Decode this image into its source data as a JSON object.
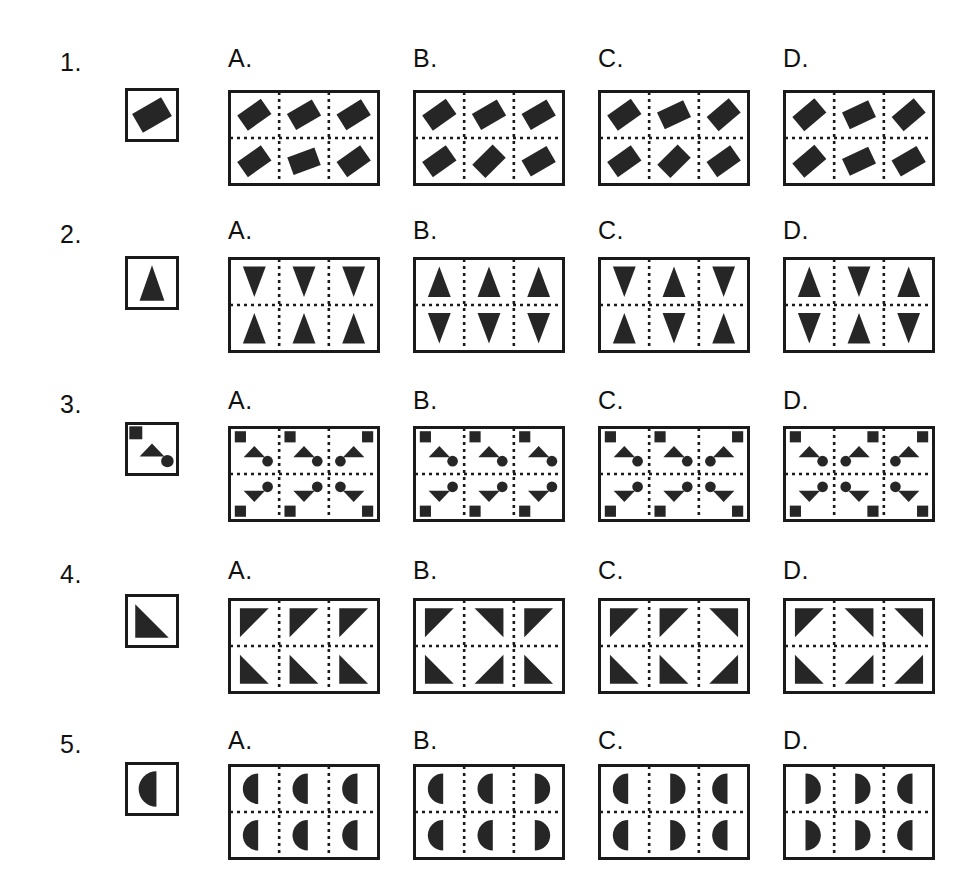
{
  "page": {
    "background": "#ffffff",
    "ink": "#1a1a1a",
    "shape_fill": "#262626",
    "question_count": 5,
    "options_per_question": 4
  },
  "option_letters": [
    "A.",
    "B.",
    "C.",
    "D."
  ],
  "questions": [
    {
      "number": "1.",
      "key": {
        "shape": "diamond",
        "rotation": 30
      },
      "options": [
        {
          "letter": "A.",
          "cells": [
            {
              "shape": "diamond",
              "rotation": 35
            },
            {
              "shape": "diamond",
              "rotation": 30
            },
            {
              "shape": "diamond",
              "rotation": 32
            },
            {
              "shape": "diamond",
              "rotation": 35
            },
            {
              "shape": "diamond",
              "rotation": 20
            },
            {
              "shape": "diamond",
              "rotation": 35
            }
          ]
        },
        {
          "letter": "B.",
          "cells": [
            {
              "shape": "diamond",
              "rotation": 35
            },
            {
              "shape": "diamond",
              "rotation": 30
            },
            {
              "shape": "diamond",
              "rotation": 30
            },
            {
              "shape": "diamond",
              "rotation": 35
            },
            {
              "shape": "diamond",
              "rotation": 45
            },
            {
              "shape": "diamond",
              "rotation": 30
            }
          ]
        },
        {
          "letter": "C.",
          "cells": [
            {
              "shape": "diamond",
              "rotation": 35
            },
            {
              "shape": "diamond",
              "rotation": 25
            },
            {
              "shape": "diamond",
              "rotation": 40
            },
            {
              "shape": "diamond",
              "rotation": 35
            },
            {
              "shape": "diamond",
              "rotation": 45
            },
            {
              "shape": "diamond",
              "rotation": 35
            }
          ]
        },
        {
          "letter": "D.",
          "cells": [
            {
              "shape": "diamond",
              "rotation": 40
            },
            {
              "shape": "diamond",
              "rotation": 25
            },
            {
              "shape": "diamond",
              "rotation": 40
            },
            {
              "shape": "diamond",
              "rotation": 40
            },
            {
              "shape": "diamond",
              "rotation": 25
            },
            {
              "shape": "diamond",
              "rotation": 30
            }
          ]
        }
      ]
    },
    {
      "number": "2.",
      "key": {
        "shape": "triangle-up",
        "rotation": 0
      },
      "options": [
        {
          "letter": "A.",
          "cells": [
            {
              "shape": "triangle-down"
            },
            {
              "shape": "triangle-down"
            },
            {
              "shape": "triangle-down"
            },
            {
              "shape": "triangle-up"
            },
            {
              "shape": "triangle-up"
            },
            {
              "shape": "triangle-up"
            }
          ]
        },
        {
          "letter": "B.",
          "cells": [
            {
              "shape": "triangle-up"
            },
            {
              "shape": "triangle-up"
            },
            {
              "shape": "triangle-up"
            },
            {
              "shape": "triangle-down"
            },
            {
              "shape": "triangle-down"
            },
            {
              "shape": "triangle-down"
            }
          ]
        },
        {
          "letter": "C.",
          "cells": [
            {
              "shape": "triangle-down"
            },
            {
              "shape": "triangle-up"
            },
            {
              "shape": "triangle-down"
            },
            {
              "shape": "triangle-up"
            },
            {
              "shape": "triangle-down"
            },
            {
              "shape": "triangle-up"
            }
          ]
        },
        {
          "letter": "D.",
          "cells": [
            {
              "shape": "triangle-up"
            },
            {
              "shape": "triangle-down"
            },
            {
              "shape": "triangle-up"
            },
            {
              "shape": "triangle-down"
            },
            {
              "shape": "triangle-up"
            },
            {
              "shape": "triangle-down"
            }
          ]
        }
      ]
    },
    {
      "number": "3.",
      "key": {
        "shape": "composite",
        "variant": "base"
      },
      "options": [
        {
          "letter": "A.",
          "cells": [
            {
              "shape": "composite",
              "variant": "tl"
            },
            {
              "shape": "composite",
              "variant": "tl"
            },
            {
              "shape": "composite",
              "variant": "tr"
            },
            {
              "shape": "composite",
              "variant": "bl"
            },
            {
              "shape": "composite",
              "variant": "bl"
            },
            {
              "shape": "composite",
              "variant": "br"
            }
          ]
        },
        {
          "letter": "B.",
          "cells": [
            {
              "shape": "composite",
              "variant": "tl"
            },
            {
              "shape": "composite",
              "variant": "tl"
            },
            {
              "shape": "composite",
              "variant": "tl"
            },
            {
              "shape": "composite",
              "variant": "bl"
            },
            {
              "shape": "composite",
              "variant": "bl"
            },
            {
              "shape": "composite",
              "variant": "bl"
            }
          ]
        },
        {
          "letter": "C.",
          "cells": [
            {
              "shape": "composite",
              "variant": "tl"
            },
            {
              "shape": "composite",
              "variant": "tl"
            },
            {
              "shape": "composite",
              "variant": "tr"
            },
            {
              "shape": "composite",
              "variant": "bl"
            },
            {
              "shape": "composite",
              "variant": "bl"
            },
            {
              "shape": "composite",
              "variant": "br"
            }
          ]
        },
        {
          "letter": "D.",
          "cells": [
            {
              "shape": "composite",
              "variant": "tl"
            },
            {
              "shape": "composite",
              "variant": "tr"
            },
            {
              "shape": "composite",
              "variant": "tr"
            },
            {
              "shape": "composite",
              "variant": "bl"
            },
            {
              "shape": "composite",
              "variant": "br"
            },
            {
              "shape": "composite",
              "variant": "br"
            }
          ]
        }
      ]
    },
    {
      "number": "4.",
      "key": {
        "shape": "corner-bl"
      },
      "options": [
        {
          "letter": "A.",
          "cells": [
            {
              "shape": "corner-tl"
            },
            {
              "shape": "corner-tl"
            },
            {
              "shape": "corner-tl"
            },
            {
              "shape": "corner-bl"
            },
            {
              "shape": "corner-bl"
            },
            {
              "shape": "corner-bl"
            }
          ]
        },
        {
          "letter": "B.",
          "cells": [
            {
              "shape": "corner-tl"
            },
            {
              "shape": "corner-tr"
            },
            {
              "shape": "corner-tl"
            },
            {
              "shape": "corner-bl"
            },
            {
              "shape": "corner-br"
            },
            {
              "shape": "corner-bl"
            }
          ]
        },
        {
          "letter": "C.",
          "cells": [
            {
              "shape": "corner-tl"
            },
            {
              "shape": "corner-tl"
            },
            {
              "shape": "corner-tr"
            },
            {
              "shape": "corner-bl"
            },
            {
              "shape": "corner-bl"
            },
            {
              "shape": "corner-br"
            }
          ]
        },
        {
          "letter": "D.",
          "cells": [
            {
              "shape": "corner-tl"
            },
            {
              "shape": "corner-tr"
            },
            {
              "shape": "corner-tr"
            },
            {
              "shape": "corner-bl"
            },
            {
              "shape": "corner-br"
            },
            {
              "shape": "corner-br"
            }
          ]
        }
      ]
    },
    {
      "number": "5.",
      "key": {
        "shape": "half-left"
      },
      "options": [
        {
          "letter": "A.",
          "cells": [
            {
              "shape": "half-left"
            },
            {
              "shape": "half-left"
            },
            {
              "shape": "half-left"
            },
            {
              "shape": "half-left"
            },
            {
              "shape": "half-left"
            },
            {
              "shape": "half-left"
            }
          ]
        },
        {
          "letter": "B.",
          "cells": [
            {
              "shape": "half-left"
            },
            {
              "shape": "half-left"
            },
            {
              "shape": "half-right"
            },
            {
              "shape": "half-left"
            },
            {
              "shape": "half-left"
            },
            {
              "shape": "half-right"
            }
          ]
        },
        {
          "letter": "C.",
          "cells": [
            {
              "shape": "half-left"
            },
            {
              "shape": "half-right"
            },
            {
              "shape": "half-left"
            },
            {
              "shape": "half-left"
            },
            {
              "shape": "half-right"
            },
            {
              "shape": "half-left"
            }
          ]
        },
        {
          "letter": "D.",
          "cells": [
            {
              "shape": "half-right"
            },
            {
              "shape": "half-right"
            },
            {
              "shape": "half-left"
            },
            {
              "shape": "half-right"
            },
            {
              "shape": "half-right"
            },
            {
              "shape": "half-left"
            }
          ]
        }
      ]
    }
  ],
  "geometry": {
    "key_box_size": 54,
    "panel_width": 152,
    "panel_height": 96,
    "frame_stroke": 3,
    "divider_dash": "3 4"
  }
}
